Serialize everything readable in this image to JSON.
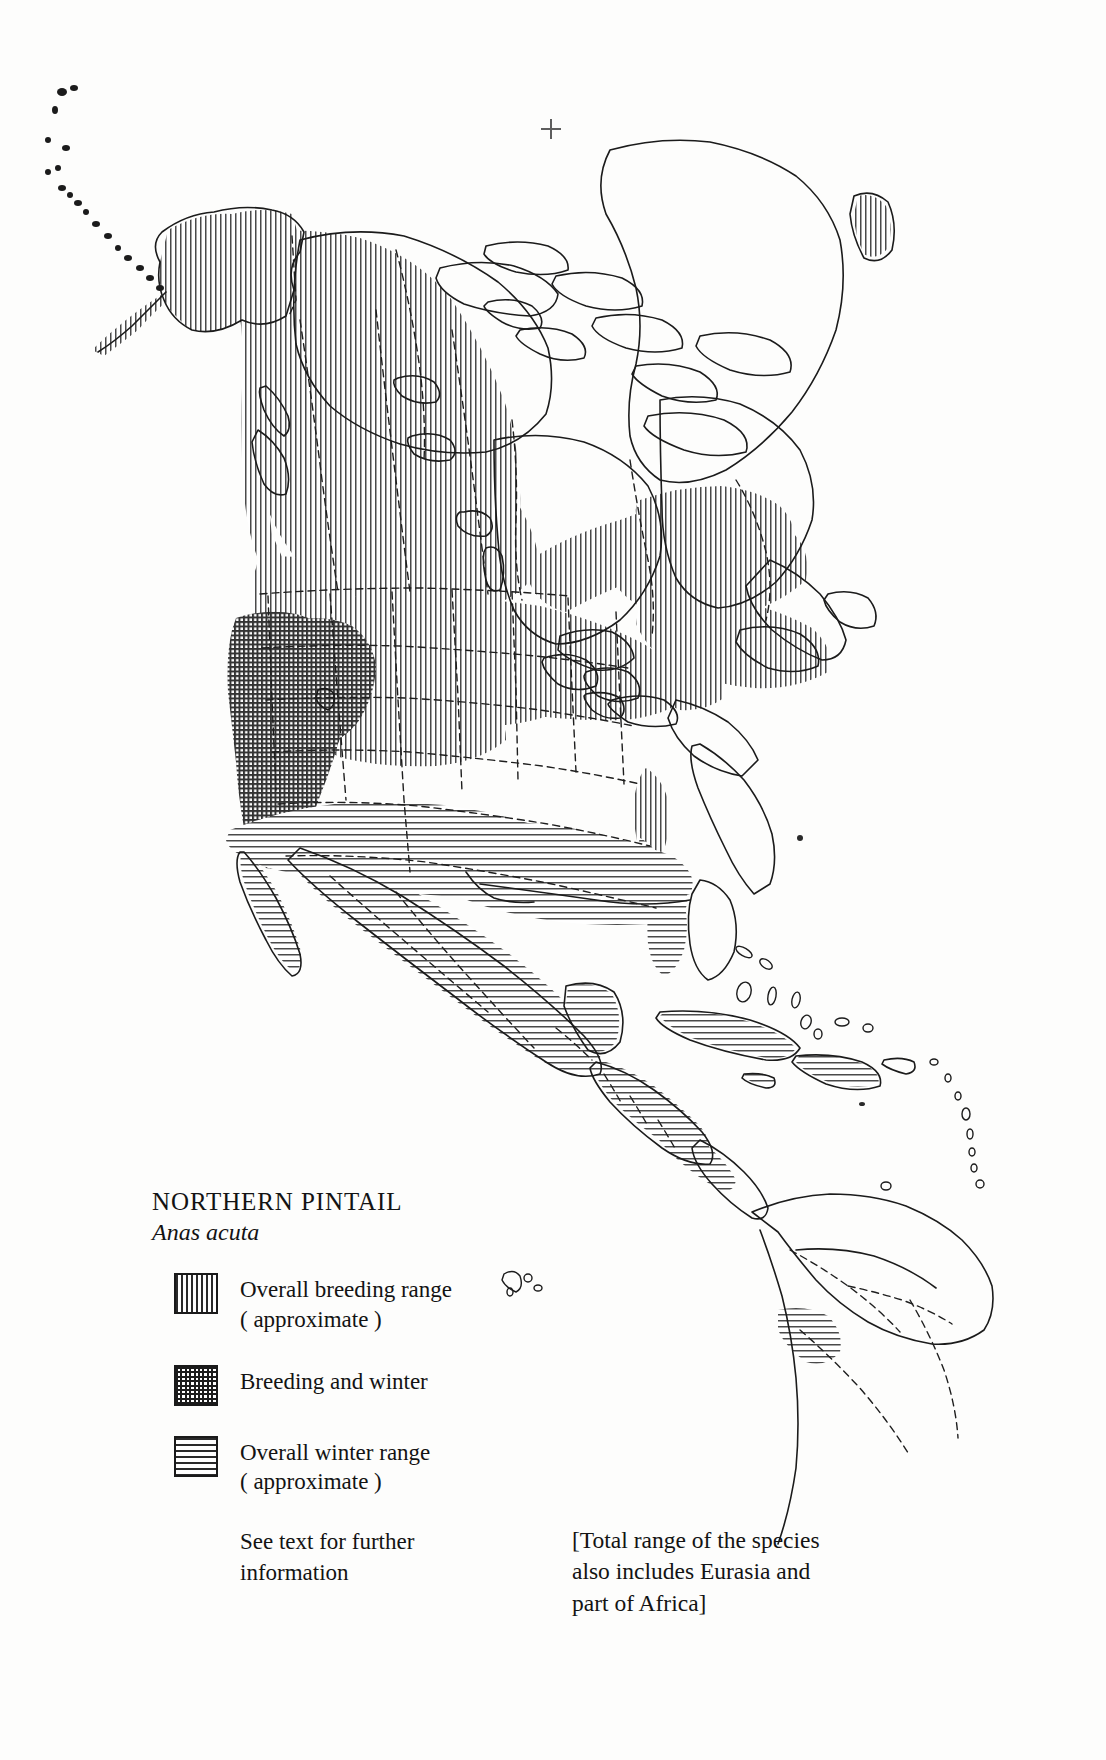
{
  "figure": {
    "kind": "species-range-map",
    "continent": "North America",
    "background_color": "#fdfdfc",
    "ink_color": "#151515"
  },
  "registration_mark": {
    "glyph": "+",
    "x": 550,
    "y": 128
  },
  "legend": {
    "title": "NORTHERN PINTAIL",
    "subtitle": "Anas acuta",
    "items": [
      {
        "pattern": "vertical-lines",
        "label_line1": "Overall breeding range",
        "label_line2": "( approximate )"
      },
      {
        "pattern": "cross-hatch",
        "label_line1": "Breeding and winter",
        "label_line2": ""
      },
      {
        "pattern": "horizontal-lines",
        "label_line1": "Overall winter range",
        "label_line2": "( approximate )"
      }
    ],
    "note_line1": "See text for further",
    "note_line2": "information"
  },
  "range_note": {
    "line1": "[Total range of the species",
    "line2": "also includes Eurasia and",
    "line3": "part of Africa]"
  },
  "map_regions": {
    "breeding": [
      "Alaska",
      "Aleutian Islands",
      "Yukon",
      "Northwest Territories",
      "British Columbia",
      "Alberta",
      "Saskatchewan",
      "Manitoba",
      "Ontario",
      "Quebec",
      "Labrador",
      "Newfoundland",
      "Maritimes",
      "Washington",
      "Oregon",
      "Idaho",
      "Montana",
      "Wyoming",
      "North Dakota",
      "South Dakota",
      "Minnesota",
      "Wisconsin",
      "Michigan",
      "Great Lakes region",
      "New England",
      "Baffin coast margin",
      "Greenland southwest tip"
    ],
    "breeding_and_winter": [
      "California",
      "Nevada",
      "southern Oregon",
      "western Utah"
    ],
    "winter": [
      "southern California",
      "Arizona",
      "New Mexico",
      "Texas",
      "Gulf Coast",
      "Louisiana",
      "Mississippi",
      "Alabama",
      "Georgia",
      "Florida",
      "Atlantic seaboard strip",
      "Mexico",
      "Baja California",
      "Yucatan",
      "Guatemala",
      "Honduras",
      "Nicaragua",
      "Costa Rica",
      "Panama",
      "Cuba",
      "Jamaica",
      "Hispaniola",
      "Puerto Rico",
      "northern Colombia"
    ],
    "unshaded": [
      "Hudson Bay",
      "Canadian Arctic Archipelago",
      "Greenland interior",
      "central United States corridor",
      "Amazonia",
      "Venezuela interior"
    ]
  }
}
